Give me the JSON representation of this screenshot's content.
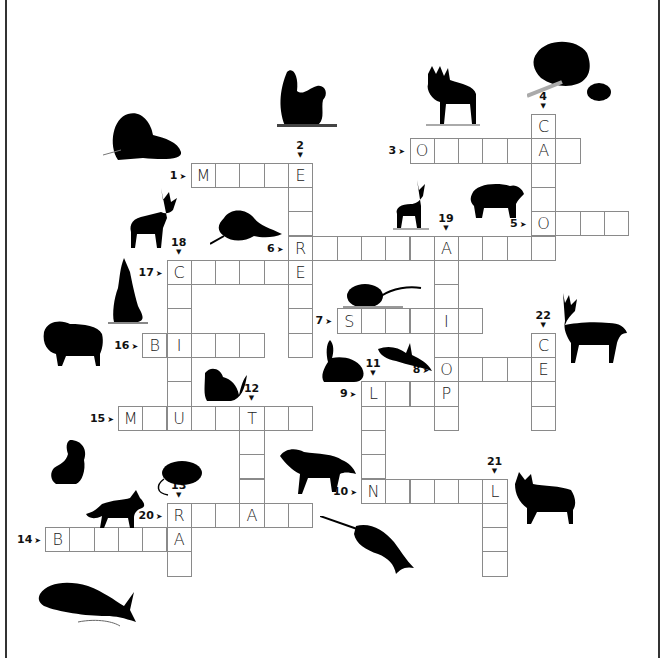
{
  "puzzle": {
    "type": "crossword",
    "theme": "North American animals",
    "cell_size": 24.3,
    "origin": {
      "x": 45,
      "y": 114
    },
    "words": [
      {
        "number": 1,
        "direction": "across",
        "row": 2,
        "col": 6,
        "length": 5,
        "given": {
          "0": "M",
          "4": "E"
        }
      },
      {
        "number": 2,
        "direction": "down",
        "row": 2,
        "col": 10,
        "length": 8,
        "given": {
          "0": "E",
          "3": "R",
          "4": "E"
        }
      },
      {
        "number": 3,
        "direction": "across",
        "row": 1,
        "col": 15,
        "length": 7,
        "given": {
          "0": "O",
          "5": "A"
        }
      },
      {
        "number": 4,
        "direction": "down",
        "row": 0,
        "col": 20,
        "length": 6,
        "given": {
          "0": "C",
          "1": "A",
          "4": "O"
        }
      },
      {
        "number": 5,
        "direction": "across",
        "row": 4,
        "col": 20,
        "length": 4,
        "given": {
          "0": "O"
        }
      },
      {
        "number": 6,
        "direction": "across",
        "row": 5,
        "col": 10,
        "length": 11,
        "given": {
          "0": "R",
          "6": "A"
        }
      },
      {
        "number": 7,
        "direction": "across",
        "row": 8,
        "col": 12,
        "length": 6,
        "given": {
          "0": "S",
          "4": "I"
        }
      },
      {
        "number": 8,
        "direction": "across",
        "row": 10,
        "col": 16,
        "length": 5,
        "given": {
          "0": "O",
          "4": "E"
        }
      },
      {
        "number": 9,
        "direction": "across",
        "row": 11,
        "col": 13,
        "length": 4,
        "given": {
          "0": "L",
          "3": "P"
        }
      },
      {
        "number": 10,
        "direction": "across",
        "row": 15,
        "col": 13,
        "length": 6,
        "given": {
          "0": "N",
          "5": "L"
        }
      },
      {
        "number": 11,
        "direction": "down",
        "row": 11,
        "col": 13,
        "length": 5,
        "given": {
          "0": "L",
          "4": "N"
        }
      },
      {
        "number": 12,
        "direction": "down",
        "row": 12,
        "col": 8,
        "length": 5,
        "given": {
          "0": "T",
          "4": "A"
        }
      },
      {
        "number": 13,
        "direction": "down",
        "row": 16,
        "col": 5,
        "length": 3,
        "given": {
          "0": "R",
          "1": "A"
        }
      },
      {
        "number": 14,
        "direction": "across",
        "row": 17,
        "col": 0,
        "length": 6,
        "given": {
          "0": "B",
          "5": "A"
        }
      },
      {
        "number": 15,
        "direction": "across",
        "row": 12,
        "col": 3,
        "length": 8,
        "given": {
          "0": "M",
          "2": "U",
          "5": "T"
        }
      },
      {
        "number": 16,
        "direction": "across",
        "row": 9,
        "col": 4,
        "length": 5,
        "given": {
          "0": "B",
          "1": "I"
        }
      },
      {
        "number": 17,
        "direction": "across",
        "row": 6,
        "col": 5,
        "length": 6,
        "given": {
          "0": "C",
          "5": "E"
        }
      },
      {
        "number": 18,
        "direction": "down",
        "row": 6,
        "col": 5,
        "length": 7,
        "given": {
          "0": "C",
          "3": "I",
          "6": "U"
        }
      },
      {
        "number": 19,
        "direction": "down",
        "row": 5,
        "col": 16,
        "length": 8,
        "given": {
          "0": "A",
          "3": "I",
          "5": "O",
          "6": "P"
        }
      },
      {
        "number": 20,
        "direction": "across",
        "row": 16,
        "col": 5,
        "length": 6,
        "given": {
          "0": "R",
          "3": "A"
        }
      },
      {
        "number": 21,
        "direction": "down",
        "row": 15,
        "col": 18,
        "length": 4,
        "given": {
          "0": "L"
        }
      },
      {
        "number": 22,
        "direction": "down",
        "row": 9,
        "col": 20,
        "length": 4,
        "given": {
          "0": "C",
          "1": "E"
        }
      }
    ]
  },
  "animals": [
    {
      "name": "walrus",
      "x": 103,
      "y": 110
    },
    {
      "name": "squirrel",
      "x": 277,
      "y": 66
    },
    {
      "name": "moose",
      "x": 418,
      "y": 66
    },
    {
      "name": "beaver",
      "x": 527,
      "y": 38
    },
    {
      "name": "caribou",
      "x": 125,
      "y": 188
    },
    {
      "name": "raccoon",
      "x": 210,
      "y": 208
    },
    {
      "name": "pronghorn",
      "x": 393,
      "y": 180
    },
    {
      "name": "black-bear",
      "x": 466,
      "y": 180
    },
    {
      "name": "coyote-howling",
      "x": 108,
      "y": 258
    },
    {
      "name": "mouse",
      "x": 343,
      "y": 278
    },
    {
      "name": "bison",
      "x": 40,
      "y": 320
    },
    {
      "name": "rabbit",
      "x": 318,
      "y": 340
    },
    {
      "name": "orca",
      "x": 378,
      "y": 343
    },
    {
      "name": "white-tailed-deer",
      "x": 553,
      "y": 293
    },
    {
      "name": "marten",
      "x": 201,
      "y": 365
    },
    {
      "name": "skunk",
      "x": 50,
      "y": 440
    },
    {
      "name": "rat",
      "x": 152,
      "y": 459
    },
    {
      "name": "gray-wolf",
      "x": 280,
      "y": 444
    },
    {
      "name": "red-fox",
      "x": 86,
      "y": 490
    },
    {
      "name": "narwhal",
      "x": 320,
      "y": 516
    },
    {
      "name": "lynx",
      "x": 515,
      "y": 472
    },
    {
      "name": "beluga-whale",
      "x": 38,
      "y": 578
    }
  ]
}
